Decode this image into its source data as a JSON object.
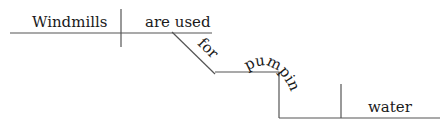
{
  "diagram": {
    "type": "sentence-diagram",
    "words": {
      "subject": "Windmills",
      "verb": "are used",
      "preposition": "for",
      "gerund": "pumping",
      "object": "water"
    },
    "colors": {
      "line": "#555555",
      "text": "#1a1a1a",
      "background": "#ffffff"
    }
  }
}
